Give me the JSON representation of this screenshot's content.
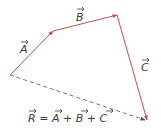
{
  "diagram": {
    "colors": {
      "vector": "#c0504d",
      "resultant": "#4a5a8a",
      "text": "#3a3a3a"
    },
    "vectors": [
      {
        "name": "A",
        "label": "A",
        "from": [
          10,
          75
        ],
        "to": [
          53,
          31
        ]
      },
      {
        "name": "B",
        "label": "B",
        "from": [
          53,
          31
        ],
        "to": [
          117,
          15
        ]
      },
      {
        "name": "C",
        "label": "C",
        "from": [
          117,
          15
        ],
        "to": [
          147,
          120
        ]
      }
    ],
    "resultant": {
      "name": "R",
      "from": [
        10,
        75
      ],
      "to": [
        147,
        120
      ],
      "style": "dashed"
    },
    "equation": {
      "lhs": "R",
      "eq": " = ",
      "a": "A",
      "plus1": " + ",
      "b": "B",
      "plus2": " + ",
      "c": "C"
    }
  }
}
